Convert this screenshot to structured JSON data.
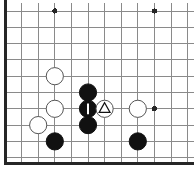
{
  "board": {
    "title": "Go board diagram",
    "background_color": "#ffffff",
    "line_color": "#8a8a8a",
    "edge_color": "#262626",
    "black_color": "#111111",
    "white_color": "#ffffff",
    "white_outline_color": "#555555",
    "line_width": 1,
    "edge_width": 3,
    "stone_radius": 8.6,
    "geometry": {
      "x_lines": [
        5,
        21.6,
        38.2,
        54.8,
        71.4,
        88,
        104.6,
        121.2,
        137.8,
        154.4,
        171,
        187.6
      ],
      "y_lines": [
        11,
        27.3,
        43.6,
        59.9,
        76.2,
        92.5,
        108.8,
        125.1,
        141.4,
        157.7
      ],
      "left_edge_x": 5,
      "bottom_edge_y": 163,
      "top_line_y": 11,
      "vertical_line_top_y": 3,
      "vertical_line_bottom_y": 163
    },
    "star_points": [
      {
        "name": "star-point-top-left",
        "x": 54.8,
        "y": 11,
        "r": 2.6
      },
      {
        "name": "star-point-top-right",
        "x": 154.4,
        "y": 11,
        "r": 2.6
      },
      {
        "name": "star-point-center-right",
        "x": 154.4,
        "y": 108.8,
        "r": 2.6
      }
    ],
    "stones": [
      {
        "id": "white-1",
        "color": "white",
        "x": 54.8,
        "y": 76.2,
        "mark": "none",
        "label": "White stone"
      },
      {
        "id": "white-2",
        "color": "white",
        "x": 54.8,
        "y": 108.8,
        "mark": "none",
        "label": "White stone"
      },
      {
        "id": "white-3",
        "color": "white",
        "x": 38.2,
        "y": 125.1,
        "mark": "none",
        "label": "White stone"
      },
      {
        "id": "black-1",
        "color": "black",
        "x": 88.0,
        "y": 92.5,
        "mark": "none",
        "label": "Black stone"
      },
      {
        "id": "black-2",
        "color": "black",
        "x": 88.0,
        "y": 108.8,
        "mark": "bar",
        "label": "Black stone with vertical bar mark"
      },
      {
        "id": "black-3",
        "color": "black",
        "x": 88.0,
        "y": 125.1,
        "mark": "none",
        "label": "Black stone"
      },
      {
        "id": "white-4",
        "color": "white",
        "x": 104.6,
        "y": 108.8,
        "mark": "triangle",
        "label": "White stone with triangle mark"
      },
      {
        "id": "white-5",
        "color": "white",
        "x": 137.8,
        "y": 108.8,
        "mark": "none",
        "label": "White stone"
      },
      {
        "id": "black-4",
        "color": "black",
        "x": 54.8,
        "y": 141.4,
        "mark": "none",
        "label": "Black stone"
      },
      {
        "id": "black-5",
        "color": "black",
        "x": 137.8,
        "y": 141.4,
        "mark": "none",
        "label": "Black stone"
      }
    ],
    "marks": {
      "triangle_label": "triangle-mark",
      "bar_label": "vertical-bar-mark",
      "triangle_color": "#111111",
      "bar_color": "#ffffff"
    }
  }
}
